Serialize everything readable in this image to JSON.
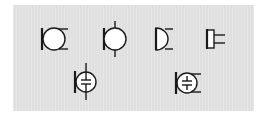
{
  "diagram": {
    "background_color": "#e3e3e3",
    "stroke_color": "#1a1a1a",
    "fill_color": "#ffffff",
    "symbols": [
      {
        "id": "mic-basic",
        "label": "Microphone",
        "row": 1,
        "col": 1
      },
      {
        "id": "mic-with-leads",
        "label": "Microphone (vertical leads)",
        "row": 1,
        "col": 2
      },
      {
        "id": "mic-half-round",
        "label": "Microphone (half-round)",
        "row": 1,
        "col": 3
      },
      {
        "id": "mic-rectangular",
        "label": "Microphone (rectangular)",
        "row": 1,
        "col": 4
      },
      {
        "id": "condenser-mic-leads",
        "label": "Condenser microphone (vertical leads)",
        "row": 2,
        "col": 1
      },
      {
        "id": "condenser-mic",
        "label": "Condenser microphone",
        "row": 2,
        "col": 2
      }
    ]
  }
}
